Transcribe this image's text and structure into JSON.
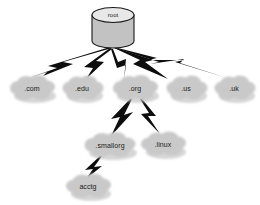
{
  "diagram": {
    "type": "tree-diagram",
    "background_color": "#ffffff",
    "node_fill_color": "#c9c9c9",
    "connector_color": "#0d0d0d",
    "cylinder_fill_color": "#c2c2c2",
    "cylinder_top_color": "#e8e8e8",
    "root": {
      "label": "root",
      "shape": "cylinder",
      "x": 113,
      "y": 28
    },
    "nodes": [
      {
        "id": "com",
        "label": ".com",
        "shape": "cloud",
        "x": 32,
        "y": 88,
        "rx": 23,
        "ry": 11,
        "level": 1
      },
      {
        "id": "edu",
        "label": ".edu",
        "shape": "cloud",
        "x": 82,
        "y": 88,
        "rx": 20,
        "ry": 11,
        "level": 1
      },
      {
        "id": "org",
        "label": ".org",
        "shape": "cloud",
        "x": 135,
        "y": 88,
        "rx": 23,
        "ry": 11,
        "level": 1
      },
      {
        "id": "us",
        "label": ".us",
        "shape": "cloud",
        "x": 186,
        "y": 88,
        "rx": 20,
        "ry": 11,
        "level": 1
      },
      {
        "id": "uk",
        "label": ".uk",
        "shape": "cloud",
        "x": 234,
        "y": 88,
        "rx": 20,
        "ry": 11,
        "level": 1
      },
      {
        "id": "smallorg",
        "label": ".smallorg",
        "shape": "cloud",
        "x": 110,
        "y": 145,
        "rx": 26,
        "ry": 11,
        "level": 2
      },
      {
        "id": "linux",
        "label": ".linux",
        "shape": "cloud",
        "x": 163,
        "y": 144,
        "rx": 22,
        "ry": 11,
        "level": 2
      },
      {
        "id": "acctg",
        "label": "acctg",
        "shape": "cloud",
        "x": 88,
        "y": 186,
        "rx": 22,
        "ry": 11,
        "level": 3
      }
    ],
    "edges": [
      {
        "from": "root",
        "to": "com",
        "style": "lightning"
      },
      {
        "from": "root",
        "to": "edu",
        "style": "lightning"
      },
      {
        "from": "root",
        "to": "org",
        "style": "lightning"
      },
      {
        "from": "root",
        "to": "us",
        "style": "lightning"
      },
      {
        "from": "root",
        "to": "uk",
        "style": "lightning"
      },
      {
        "from": "org",
        "to": "smallorg",
        "style": "lightning"
      },
      {
        "from": "org",
        "to": "linux",
        "style": "lightning"
      },
      {
        "from": "smallorg",
        "to": "acctg",
        "style": "lightning"
      }
    ]
  }
}
